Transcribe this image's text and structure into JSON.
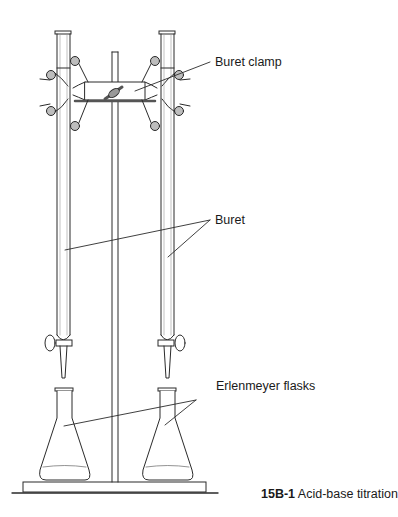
{
  "figure": {
    "labels": {
      "buret_clamp": "Buret clamp",
      "buret": "Buret",
      "erlenmeyer_flasks": "Erlenmeyer flasks"
    },
    "caption": {
      "number": "15B-1",
      "text": "Acid-base titration"
    },
    "colors": {
      "line": "#2a2a2a",
      "fill": "#ffffff",
      "shade": "#bdbdbd"
    }
  }
}
